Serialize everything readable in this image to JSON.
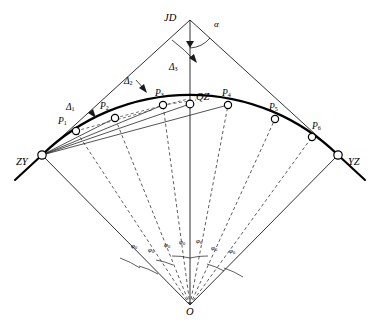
{
  "diagram": {
    "colors": {
      "line": "#1a1a1a",
      "curve": "#000000",
      "dashed": "#333333",
      "node_fill": "#ffffff",
      "background": "#ffffff"
    },
    "vertices": {
      "jd": {
        "label": "JD",
        "x": 190,
        "y": 20
      },
      "zy": {
        "label": "ZY",
        "x": 42,
        "y": 155
      },
      "yz": {
        "label": "YZ",
        "x": 338,
        "y": 155
      },
      "qz": {
        "label": "QZ",
        "x": 190,
        "y": 104
      },
      "o": {
        "label": "O",
        "x": 190,
        "y": 305
      }
    },
    "curve_points": [
      {
        "label": "P",
        "sub": "1",
        "x": 76,
        "y": 131
      },
      {
        "label": "P",
        "sub": "2",
        "x": 115,
        "y": 118
      },
      {
        "label": "P",
        "sub": "3",
        "x": 163,
        "y": 105
      },
      {
        "label": "P",
        "sub": "4",
        "x": 228,
        "y": 105
      },
      {
        "label": "P",
        "sub": "5",
        "x": 275,
        "y": 119
      },
      {
        "label": "P",
        "sub": "6",
        "x": 312,
        "y": 137
      }
    ],
    "deflection_angles": [
      {
        "label": "Δ",
        "sub": "1",
        "x": 73,
        "y": 110
      },
      {
        "label": "Δ",
        "sub": "2",
        "x": 130,
        "y": 84
      },
      {
        "label": "Δ",
        "sub": "3",
        "x": 175,
        "y": 70
      }
    ],
    "intersection_angle": {
      "label": "α",
      "x": 210,
      "y": 25
    },
    "central_angles": [
      {
        "label": "φ",
        "sub": "0",
        "x": 136,
        "y": 248
      },
      {
        "label": "φ",
        "sub": "0",
        "x": 152,
        "y": 251
      },
      {
        "label": "φ",
        "sub": "0",
        "x": 168,
        "y": 247
      },
      {
        "label": "φ",
        "sub": "0",
        "x": 183,
        "y": 244
      },
      {
        "label": "φ",
        "sub": "0",
        "x": 200,
        "y": 243
      },
      {
        "label": "φ",
        "sub": "0",
        "x": 215,
        "y": 250
      },
      {
        "label": "φ",
        "sub": "0",
        "x": 233,
        "y": 252
      }
    ]
  }
}
